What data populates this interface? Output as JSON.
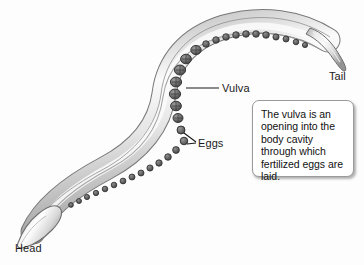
{
  "figure": {
    "background_color": "#fdfdfd",
    "label_color": "#1a1a1a"
  },
  "labels": {
    "vulva": "Vulva",
    "eggs": "Eggs",
    "head": "Head",
    "tail": "Tail"
  },
  "callout": {
    "text": "The vulva is an opening into the body cavity through which fertilized eggs are laid.",
    "border_color": "#9a9a9a",
    "background_color": "#ffffff",
    "text_color": "#111111"
  },
  "illustration": {
    "name": "nematode-worm",
    "body_fill_light": "#f2f2f2",
    "body_fill_mid": "#d2d2d2",
    "body_outline": "#6e6e6e",
    "egg_fill": "#6a6a6a",
    "egg_outline": "#3a3a3a",
    "leader_line_color": "#1a1a1a"
  }
}
